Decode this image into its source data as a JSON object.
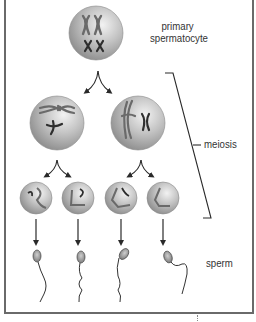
{
  "diagram": {
    "labels": {
      "primary_line1": "primary",
      "primary_line2": "spermatocyte",
      "meiosis": "meiosis",
      "sperm": "sperm"
    },
    "stages": [
      {
        "name": "primary spermatocyte",
        "count": 1
      },
      {
        "name": "secondary spermatocytes",
        "count": 2
      },
      {
        "name": "spermatids",
        "count": 4
      },
      {
        "name": "sperm",
        "count": 4
      }
    ],
    "colors": {
      "cell_light": "#eeeeee",
      "cell_mid": "#bdbdbd",
      "cell_dark": "#8a8a8a",
      "chromosome": "#3a3a3a",
      "line": "#2a2a2a",
      "frame": "#6a6a6a",
      "text": "#333333"
    }
  }
}
